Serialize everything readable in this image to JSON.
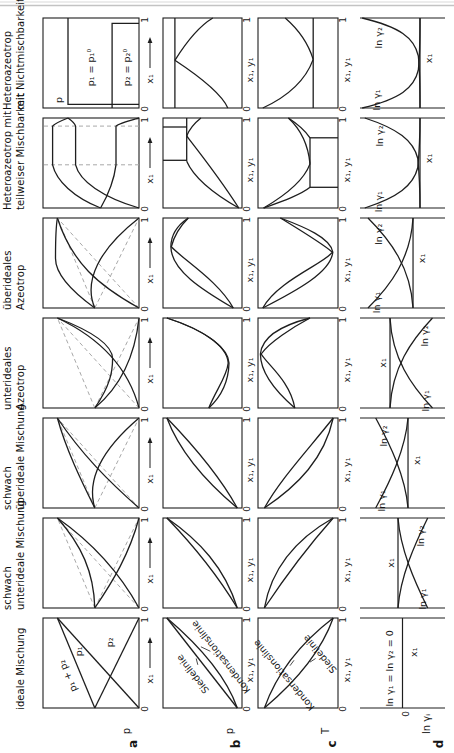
{
  "figure_title": "Arten des Phasengleichgewichtsverhaltens binaerer Mischungen",
  "colors": {
    "line": "#1e1e1e",
    "dash": "#a9a9a9",
    "text": "#141414",
    "rule": "#c3c3c3",
    "background": "#ffffff"
  },
  "figure": {
    "rows": [
      {
        "letter": "a",
        "axis": "p"
      },
      {
        "letter": "b",
        "axis": "p"
      },
      {
        "letter": "c",
        "axis": "T"
      },
      {
        "letter": "d",
        "axis": "ln γᵢ"
      }
    ],
    "strips": {
      "a": {
        "label": "x₁",
        "tick0": "0",
        "tick1": "1",
        "arrow": "→"
      },
      "b": {
        "label": "x₁, y₁"
      },
      "c": {
        "label": "x₁, y₁"
      }
    },
    "columns": [
      {
        "id": "ideale-mischung",
        "header": [
          "ideale Mischung"
        ],
        "plots": {
          "a": {
            "curves": [
              {
                "d": "M 0 0 L 1 .85"
              },
              {
                "d": "M 0 .46 L 1 0"
              },
              {
                "d": "M 0 .46 L 1 .85"
              }
            ],
            "labels": [
              {
                "text": "p₁ + p₂",
                "x": 0.36,
                "h": 0.74,
                "rot": -23
              },
              {
                "text": "p₁",
                "x": 0.63,
                "h": 0.62
              },
              {
                "text": "p₂",
                "x": 0.73,
                "h": 0.3
              }
            ]
          },
          "b": {
            "curves": [
              {
                "d": "M 0 .06 L 1 .95"
              },
              {
                "d": "M 0 .06 C .35 .2 .7 .55 1 .95"
              }
            ],
            "labels": [
              {
                "text": "Siedelinie",
                "x": 0.38,
                "h": 0.62,
                "rot": -38
              },
              {
                "text": "Kondensationslinie",
                "x": 0.57,
                "h": 0.27,
                "rot": -38
              }
            ],
            "leaders": [
              {
                "d": "M .48 .56 L .55 .58"
              },
              {
                "d": "M .63 .40 L .68 .52"
              }
            ]
          },
          "c": {
            "curves": [
              {
                "d": "M 0 .92 C .35 .78 .7 .5 1 .06"
              },
              {
                "d": "M 0 .92 C .3 .52 .65 .2 1 .06"
              }
            ],
            "labels": [
              {
                "text": "Kondensationslinie",
                "x": 0.37,
                "h": 0.67,
                "rot": -40
              },
              {
                "text": "Siedelinie",
                "x": 0.6,
                "h": 0.23,
                "rot": -40
              }
            ],
            "leaders": [
              {
                "d": "M .47 .60 L .53 .55"
              },
              {
                "d": "M .55 .28 L .51 .35"
              }
            ]
          },
          "d": {
            "zero": 0.5,
            "amp": 0,
            "shape": "none",
            "tick": "0",
            "labels": [
              {
                "text": "ln γ₁ = ln γ₂ = 0",
                "x": 0.44,
                "h": 0.65
              },
              {
                "text": "x₁",
                "x": 0.62,
                "h": 0.36
              }
            ]
          }
        }
      },
      {
        "id": "schwach-unterideale-mischung",
        "header": [
          "schwach",
          "unterideale Mischung"
        ],
        "plots": {
          "a": {
            "curves": [
              {
                "d": "M 0 0 L 1 .85",
                "dash": true
              },
              {
                "d": "M 0 .46 L 1 0",
                "dash": true
              },
              {
                "d": "M 0 .46 L 1 .85",
                "dash": true
              },
              {
                "d": "M 0 0 C .35 .18 .7 .45 1 .85"
              },
              {
                "d": "M 0 .46 C .3 .27 .6 .1 1 0"
              },
              {
                "d": "M 0 .46 C .4 .47 .7 .6 1 .85"
              }
            ],
            "labels": []
          },
          "b": {
            "curves": [
              {
                "d": "M 0 .06 C .35 .3 .7 .62 1 .95"
              },
              {
                "d": "M 0 .06 C .45 .22 .75 .54 1 .95"
              }
            ],
            "labels": []
          },
          "c": {
            "curves": [
              {
                "d": "M 0 .92 C .4 .84 .75 .56 1 .06"
              },
              {
                "d": "M 0 .92 C .32 .68 .7 .36 1 .06"
              }
            ],
            "labels": []
          },
          "d": {
            "zero": 0.553,
            "amp": -0.35,
            "shape": "gentle",
            "labels": [
              {
                "text": "ln γ₁",
                "x": 0.1,
                "h": 0.26
              },
              {
                "text": "ln γ₂",
                "x": 0.8,
                "h": 0.28
              },
              {
                "text": "x₁",
                "x": 0.5,
                "h": 0.64
              }
            ]
          }
        }
      },
      {
        "id": "schwach-ueberideale-mischung",
        "header": [
          "schwach",
          "überideale Mischung"
        ],
        "plots": {
          "a": {
            "curves": [
              {
                "d": "M 0 0 L 1 .85",
                "dash": true
              },
              {
                "d": "M 0 .46 L 1 0",
                "dash": true
              },
              {
                "d": "M 0 .46 L 1 .85",
                "dash": true
              },
              {
                "d": "M 0 0 C .3 .32 .6 .6 1 .85"
              },
              {
                "d": "M 0 .46 C .35 .56 .7 .33 1 0"
              },
              {
                "d": "M 0 .46 C .3 .6 .65 .76 1 .85"
              }
            ],
            "labels": []
          },
          "b": {
            "curves": [
              {
                "d": "M 0 .06 C .25 .4 .6 .78 1 .95"
              },
              {
                "d": "M 0 .06 C .35 .28 .7 .62 1 .95"
              }
            ],
            "labels": []
          },
          "c": {
            "curves": [
              {
                "d": "M 0 .92 C .32 .72 .62 .4 1 .06"
              },
              {
                "d": "M 0 .92 C .25 .5 .55 .17 1 .06"
              }
            ],
            "labels": []
          },
          "d": {
            "zero": 0.435,
            "amp": 0.38,
            "shape": "gentle",
            "labels": [
              {
                "text": "ln γ₁",
                "x": 0.08,
                "h": 0.74
              },
              {
                "text": "ln γ₂",
                "x": 0.8,
                "h": 0.72
              },
              {
                "text": "x₁",
                "x": 0.53,
                "h": 0.33
              }
            ]
          }
        }
      },
      {
        "id": "unterideales-azeotrop",
        "header": [
          "unterideales",
          "Azeotrop"
        ],
        "plots": {
          "a": {
            "curves": [
              {
                "d": "M 0 0 L 1 .85",
                "dash": true
              },
              {
                "d": "M 0 .46 L 1 0",
                "dash": true
              },
              {
                "d": "M 0 .46 L 1 .85",
                "dash": true
              },
              {
                "d": "M 0 0 C .4 .1 .75 .35 1 .85"
              },
              {
                "d": "M 0 .46 C .25 .18 .6 .04 1 0"
              },
              {
                "d": "M 0 .46 C .25 .3 .4 .275 .55 .275 C .7 .28 .85 .48 1 .85"
              }
            ],
            "labels": []
          },
          "b": {
            "curves": [
              {
                "d": "M 0 .42 C .2 .33 .35 .19 .5 .175 C .7 .19 .88 .52 1 .95"
              },
              {
                "d": "M 0 .42 C .13 .26 .3 .17 .5 .165 C .65 .17 .85 .42 1 .95"
              }
            ],
            "labels": []
          },
          "c": {
            "curves": [
              {
                "d": "M 0 .54 C .2 .8 .4 .97 .6 .97 C .8 .95 .92 .7 1 .35"
              },
              {
                "d": "M 0 .54 C .3 .6 .48 .88 .6 .96 C .73 .86 .9 .56 1 .35"
              }
            ],
            "labels": []
          },
          "d": {
            "zero": 0.647,
            "amp": -0.5,
            "shape": "az",
            "labels": [
              {
                "text": "ln γ₁",
                "x": 0.08,
                "h": 0.22
              },
              {
                "text": "ln γ₂",
                "x": 0.8,
                "h": 0.24
              },
              {
                "text": "x₁",
                "x": 0.5,
                "h": 0.73
              }
            ]
          }
        }
      },
      {
        "id": "ueberideales-azeotrop",
        "header": [
          "überideales",
          "Azeotrop"
        ],
        "plots": {
          "a": {
            "curves": [
              {
                "d": "M 0 0 L 1 .85",
                "dash": true
              },
              {
                "d": "M 0 .46 L 1 0",
                "dash": true
              },
              {
                "d": "M 0 .46 L 1 .85",
                "dash": true
              },
              {
                "d": "M 0 0 C .25 .42 .5 .7 1 .85"
              },
              {
                "d": "M 0 .46 C .3 .58 .65 .42 1 0"
              },
              {
                "d": "M 0 .46 C .2 .72 .38 .87 .55 .87 C .72 .87 .88 .87 1 .85"
              }
            ],
            "labels": []
          },
          "b": {
            "curves": [
              {
                "d": "M 0 .11 C .2 .5 .42 .9 .68 .9 C .82 .9 .93 .8 1 .68"
              },
              {
                "d": "M 0 .11 C .3 .3 .52 .72 .68 .895 C .84 .85 .93 .76 1 .68"
              }
            ],
            "labels": []
          },
          "c": {
            "curves": [
              {
                "d": "M 0 .94 C .3 .76 .5 .16 .62 .07 C .72 .2 .88 .5 1 .72"
              },
              {
                "d": "M 0 .94 C .2 .5 .4 .09 .62 .065 C .78 .09 .9 .42 1 .72"
              }
            ],
            "labels": []
          },
          "d": {
            "zero": 0.376,
            "amp": 0.53,
            "shape": "az",
            "labels": [
              {
                "text": "ln γ₁",
                "x": 0.06,
                "h": 0.8
              },
              {
                "text": "ln γ₂",
                "x": 0.82,
                "h": 0.78
              },
              {
                "text": "x₁",
                "x": 0.55,
                "h": 0.27
              }
            ]
          }
        }
      },
      {
        "id": "heteroazeotrop-teilweise",
        "header": [
          "Heteroazeotrop mit",
          "teilweiser Mischbarkeit"
        ],
        "plots": {
          "a": {
            "curves": [
              {
                "d": "M .48 0 L .48 1",
                "dash": true
              },
              {
                "d": "M .91 0 L .91 1",
                "dash": true
              },
              {
                "d": "M 0 0 C .12 .38 .3 .62 .48 .66 L .91 .66 C .94 .67 .97 .7 1 .74"
              },
              {
                "d": "M 0 .40 C .15 .32 .3 .26 .48 .24 L .91 .24 C .94 .21 .97 .1 1 0"
              },
              {
                "d": "M 0 .40 C .12 .68 .3 .86 .48 .90 L .91 .90 C .94 .88 .97 .81 1 .74"
              }
            ],
            "labels": []
          },
          "b": {
            "curves": [
              {
                "d": "M .52 .70 L 1 .70"
              },
              {
                "d": "M .53 .70 L .53 1"
              },
              {
                "d": "M .90 .70 L .90 1"
              },
              {
                "d": "M 0 .04 C .2 .44 .38 .63 .52 .70"
              },
              {
                "d": "M 0 .04 C .33 .28 .62 .54 .80 .70"
              },
              {
                "d": "M 1 .52 C .93 .62 .87 .67 .80 .70"
              }
            ],
            "labels": []
          },
          "c": {
            "curves": [
              {
                "d": "M .23 .35 L .78 .35"
              },
              {
                "d": "M .23 0 L .23 .35"
              },
              {
                "d": "M .78 0 L .78 .35"
              },
              {
                "d": "M 0 .93 C .08 .68 .15 .46 .23 .35"
              },
              {
                "d": "M 0 .93 C .16 .62 .32 .42 .49 .35"
              },
              {
                "d": "M 1 .62 C .93 .5 .86 .41 .78 .35"
              },
              {
                "d": "M 1 .62 C .86 .45 .68 .37 .49 .35"
              }
            ],
            "labels": []
          },
          "d": {
            "zero": 0.294,
            "amp": 0.65,
            "shape": "steep",
            "labels": [
              {
                "text": "ln γ₁",
                "x": 0.07,
                "h": 0.78
              },
              {
                "text": "ln γ₂",
                "x": 0.8,
                "h": 0.76
              },
              {
                "text": "x₁",
                "x": 0.55,
                "h": 0.19
              }
            ]
          }
        }
      },
      {
        "id": "heteroazeotrop-nichtmischbar",
        "header": [
          "Heteroazeotrop",
          "mit Nichtmischbarkeit"
        ],
        "plots": {
          "a": {
            "curves": [
              {
                "d": "M .04 0 L .04 .74 L 1 .74"
              },
              {
                "d": "M 0 .28 L .94 .28 L .94 0"
              }
            ],
            "labels": [
              {
                "text": "p",
                "x": 0.09,
                "h": 0.83
              },
              {
                "text": "p₁ = p₁⁰",
                "x": 0.45,
                "h": 0.5
              },
              {
                "text": "p₂ = p₂⁰",
                "x": 0.45,
                "h": 0.12
              }
            ]
          },
          "b": {
            "curves": [
              {
                "d": "M 0 .85 L 1 .85"
              },
              {
                "d": "M 0 .18 Q .2 .28 .53 .85"
              },
              {
                "d": "M 1 .37 Q .88 .6 .53 .85"
              }
            ],
            "labels": []
          },
          "c": {
            "curves": [
              {
                "d": "M 0 .31 L 1 .31"
              },
              {
                "d": "M 0 .94 Q .2 .45 .54 .31"
              },
              {
                "d": "M 1 .66 Q .8 .40 .54 .31"
              }
            ],
            "labels": []
          },
          "d": {
            "zero": 0.294,
            "amp": 0.68,
            "shape": "steeper",
            "labels": [
              {
                "text": "ln γ₁",
                "x": 0.09,
                "h": 0.8
              },
              {
                "text": "ln γ₂",
                "x": 0.78,
                "h": 0.78
              },
              {
                "text": "x₁",
                "x": 0.55,
                "h": 0.19
              }
            ]
          }
        }
      }
    ]
  }
}
